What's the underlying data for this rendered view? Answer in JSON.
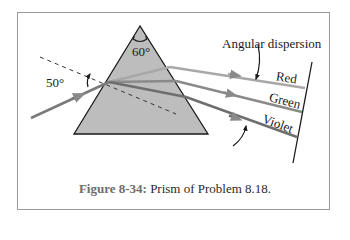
{
  "figure": {
    "number": "Figure 8-34:",
    "caption": " Prism of Problem 8.18."
  },
  "labels": {
    "apex_angle": "60°",
    "incidence_angle": "50°",
    "angular_dispersion": "Angular dispersion",
    "ray_red": "Red",
    "ray_green": "Green",
    "ray_violet": "Violet"
  },
  "colors": {
    "frame_border": "#9a9a9a",
    "prism_fill": "#bdbdbd",
    "prism_edge": "#1a1a1a",
    "ray_incident": "#7a7a7a",
    "ray_red": "#a8a8a8",
    "ray_green": "#8a8a8a",
    "ray_violet": "#6e6e6e",
    "caption_number": "#6d6d6d"
  }
}
